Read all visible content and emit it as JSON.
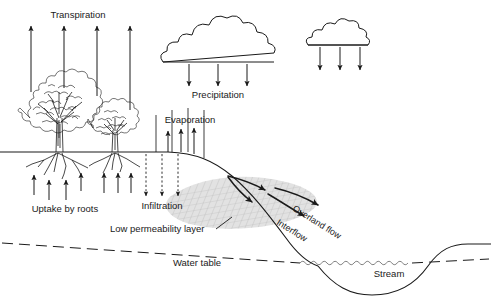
{
  "diagram": {
    "background_color": "#ffffff",
    "ink_color": "#1a1a1a",
    "shade_color": "#d8d8d8",
    "labels": {
      "transpiration": "Transpiration",
      "precipitation": "Precipitation",
      "evaporation": "Evaporation",
      "uptake_by_roots": "Uptake by roots",
      "infiltration": "Infiltration",
      "low_permeability_layer": "Low permeability layer",
      "water_table": "Water table",
      "overland_flow": "Overland flow",
      "interflow": "Interflow",
      "stream": "Stream"
    },
    "flows": {
      "transpiration_arrow_count": 4,
      "precipitation_arrow_count_main_cloud": 3,
      "precipitation_arrow_count_small_cloud": 3,
      "evaporation_arrow_count": 3,
      "infiltration_arrow_count": 3,
      "uptake_arrow_count_left_tree": 4,
      "uptake_arrow_count_right_tree": 3,
      "cloud_count": 2,
      "tree_count": 2
    },
    "caption_fragment": ""
  }
}
